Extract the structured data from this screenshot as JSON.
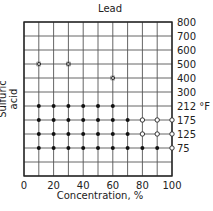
{
  "chart_data": {
    "type": "scatter",
    "title": "Lead",
    "xlabel": "Concentration, %",
    "ylabel": "Sulfuric acid",
    "x_ticks": [
      "0",
      "20",
      "40",
      "60",
      "80",
      "100"
    ],
    "y_ticks": [
      "800",
      "700",
      "600",
      "500",
      "400",
      "300",
      "212 °F",
      "175",
      "125",
      "75"
    ],
    "y_unit": "°F",
    "xlim": [
      0,
      100
    ],
    "grid": true,
    "legend": "none (symbols: filled circle = resistant, open circle = limited, × = not resistant)",
    "series": [
      {
        "name": "filled-circle",
        "marker": "●",
        "points": [
          [
            10,
            212
          ],
          [
            20,
            212
          ],
          [
            30,
            212
          ],
          [
            40,
            212
          ],
          [
            50,
            212
          ],
          [
            60,
            212
          ],
          [
            10,
            175
          ],
          [
            20,
            175
          ],
          [
            30,
            175
          ],
          [
            40,
            175
          ],
          [
            50,
            175
          ],
          [
            60,
            175
          ],
          [
            70,
            175
          ],
          [
            10,
            125
          ],
          [
            20,
            125
          ],
          [
            30,
            125
          ],
          [
            40,
            125
          ],
          [
            50,
            125
          ],
          [
            60,
            125
          ],
          [
            70,
            125
          ],
          [
            10,
            75
          ],
          [
            20,
            75
          ],
          [
            30,
            75
          ],
          [
            40,
            75
          ],
          [
            50,
            75
          ],
          [
            60,
            75
          ],
          [
            70,
            75
          ],
          [
            80,
            75
          ],
          [
            90,
            75
          ]
        ]
      },
      {
        "name": "open-circle",
        "marker": "○",
        "points": [
          [
            80,
            175
          ],
          [
            90,
            175
          ],
          [
            100,
            175
          ],
          [
            80,
            125
          ],
          [
            90,
            125
          ],
          [
            100,
            125
          ],
          [
            100,
            75
          ]
        ]
      },
      {
        "name": "cross",
        "marker": "×",
        "points": [
          [
            10,
            500
          ],
          [
            30,
            500
          ],
          [
            60,
            400
          ]
        ]
      }
    ]
  }
}
